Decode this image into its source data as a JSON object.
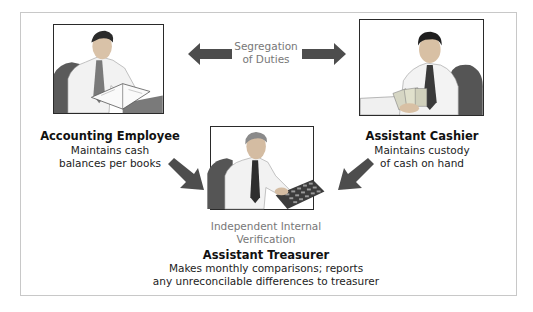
{
  "diagram": {
    "center_label": {
      "line1": "Segregation",
      "line2": "of Duties"
    },
    "roles": [
      {
        "title": "Accounting Employee",
        "desc_line1": "Maintains cash",
        "desc_line2": "balances per books",
        "illustration": "man-reading-ledger"
      },
      {
        "title": "Assistant Cashier",
        "desc_line1": "Maintains custody",
        "desc_line2": "of cash on hand",
        "illustration": "man-counting-cash"
      },
      {
        "title": "Assistant Treasurer",
        "desc_line1": "Makes monthly comparisons; reports",
        "desc_line2": "any unreconcilable differences to treasurer",
        "illustration": "man-using-calculator"
      }
    ],
    "verification_label": {
      "line1": "Independent Internal",
      "line2": "Verification"
    },
    "colors": {
      "arrow": "#4d4d4d",
      "border": "#c8c8c8",
      "label_gray": "#777777"
    }
  }
}
